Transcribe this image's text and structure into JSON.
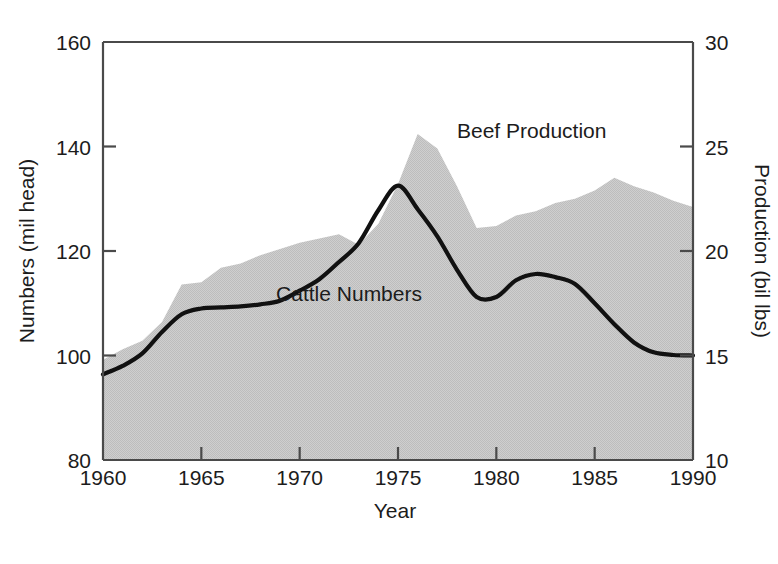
{
  "chart_data": {
    "type": "area",
    "title": "",
    "xlabel": "Year",
    "ylabel": "Numbers (mil head)",
    "y2label": "Production (bil lbs)",
    "xlim": [
      1960,
      1990
    ],
    "ylim": [
      80,
      160
    ],
    "y2lim": [
      10,
      30
    ],
    "xticks": [
      1960,
      1965,
      1970,
      1975,
      1980,
      1985,
      1990
    ],
    "xticklabels": [
      "1960",
      "1965",
      "1970",
      "1975",
      "1980",
      "1985",
      "1990"
    ],
    "yticks": [
      80,
      100,
      120,
      140,
      160
    ],
    "yticklabels": [
      "80",
      "100",
      "120",
      "140",
      "160"
    ],
    "y2ticks": [
      10,
      15,
      20,
      25,
      30
    ],
    "y2ticklabels": [
      "10",
      "15",
      "20",
      "25",
      "30"
    ],
    "grid": false,
    "legend_position": "inline-annotation",
    "colors": {
      "beef_area_fill": "#c9c9c9",
      "cattle_line": "#111111",
      "axis": "#4a4a4a",
      "background": "#ffffff"
    },
    "series": [
      {
        "name": "Beef Production",
        "type": "area",
        "axis": "right",
        "unit": "bil lbs",
        "label": "Beef Production",
        "label_x": 1978.0,
        "label_y": 25.4,
        "x": [
          1960,
          1961,
          1962,
          1963,
          1964,
          1965,
          1966,
          1967,
          1968,
          1969,
          1970,
          1971,
          1972,
          1973,
          1974,
          1975,
          1976,
          1977,
          1978,
          1979,
          1980,
          1981,
          1982,
          1983,
          1984,
          1985,
          1986,
          1987,
          1988,
          1989,
          1990
        ],
        "values": [
          14.8,
          15.3,
          15.7,
          16.6,
          18.4,
          18.5,
          19.2,
          19.4,
          19.8,
          20.1,
          20.4,
          20.6,
          20.8,
          20.3,
          21.3,
          23.2,
          25.6,
          24.9,
          23.1,
          21.1,
          21.2,
          21.7,
          21.9,
          22.3,
          22.5,
          22.9,
          23.5,
          23.1,
          22.8,
          22.4,
          22.1
        ]
      },
      {
        "name": "Cattle Numbers",
        "type": "line",
        "axis": "left",
        "unit": "mil head",
        "label": "Cattle Numbers",
        "label_x": 1968.8,
        "label_y": 110.5,
        "x": [
          1960,
          1961,
          1962,
          1963,
          1964,
          1965,
          1966,
          1967,
          1968,
          1969,
          1970,
          1971,
          1972,
          1973,
          1974,
          1975,
          1976,
          1977,
          1978,
          1979,
          1980,
          1981,
          1982,
          1983,
          1984,
          1985,
          1986,
          1987,
          1988,
          1989,
          1990
        ],
        "values": [
          96.4,
          98.0,
          100.4,
          104.5,
          107.9,
          109.0,
          109.2,
          109.4,
          109.8,
          110.5,
          112.4,
          114.6,
          117.9,
          121.5,
          127.8,
          132.5,
          128.0,
          122.8,
          116.4,
          111.2,
          111.2,
          114.4,
          115.6,
          115.0,
          113.7,
          110.0,
          106.0,
          102.5,
          100.6,
          100.1,
          100.0
        ]
      }
    ]
  },
  "axes": {
    "left_title": "Numbers (mil head)",
    "right_title": "Production (bil lbs)",
    "bottom_title": "Year"
  },
  "annotations": {
    "beef": "Beef Production",
    "cattle": "Cattle Numbers"
  }
}
